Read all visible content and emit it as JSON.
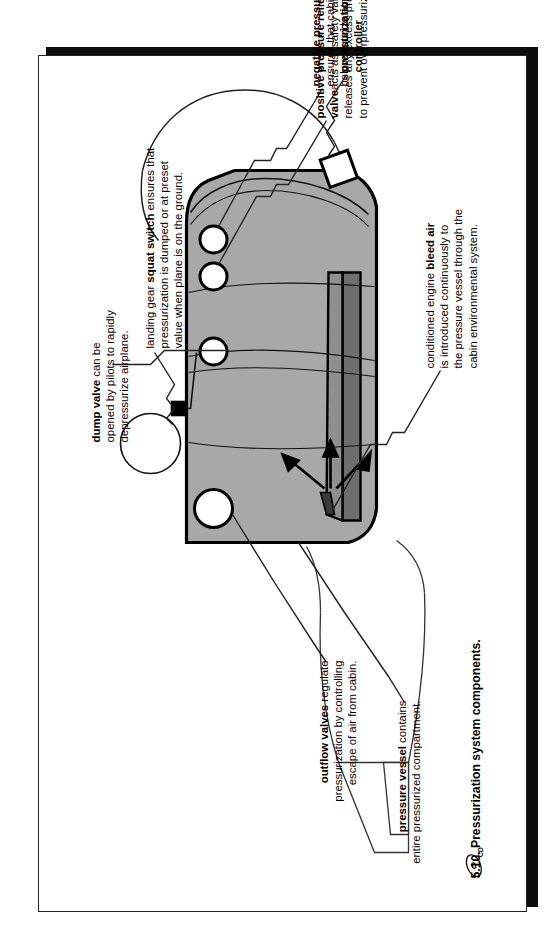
{
  "figure": {
    "caption_number": "5.10.",
    "caption_text": "Pressurization system components.",
    "cd_icon": "cd-icon"
  },
  "labels": {
    "negative_pressure_relief_valve": {
      "title": "negative pressure relief valve",
      "line1": "ensures that cabin pressure never falls",
      "line2": "below outside atmospheric pressure."
    },
    "pressurization_controller": {
      "line1": "pressurization",
      "line2": "controller"
    },
    "dump_valve": {
      "title": "dump valve",
      "title_tail": " can be",
      "line1": "opened by pilots to rapidly",
      "line2": "depressurize airplane."
    },
    "positive_pressure_relief_valve": {
      "title_line1": "positive pressure relief",
      "title_line2": "valve",
      "title_tail": "acts as “safety valve,”",
      "line1": "releases any excess pressure",
      "line2": "to prevent overpressurization."
    },
    "squat_switch": {
      "prefix": "landing gear ",
      "title": "squat switch",
      "title_tail": " ensures that",
      "line1": "pressurization is dumped or at preset",
      "line2": "value when plane is on the ground."
    },
    "bleed_air": {
      "prefix": "conditioned engine ",
      "title": "bleed air",
      "line1": "is introduced continuously to",
      "line2": "the pressure vessel through the",
      "line3": "cabin environmental system."
    },
    "outflow_valves": {
      "title": "outflow valves",
      "title_tail": " regulate",
      "line1": "pressurization by controlling",
      "line2": "escape of air from cabin."
    },
    "pressure_vessel": {
      "title": "pressure vessel",
      "title_tail": " contains",
      "line1": "entire pressurized compartment."
    }
  },
  "colors": {
    "fuselage_fill": "#a8a8a8",
    "floor_dark": "#6e6e6e",
    "outline": "#000000",
    "paper": "#ffffff",
    "shadow": "#0d0d0d"
  }
}
